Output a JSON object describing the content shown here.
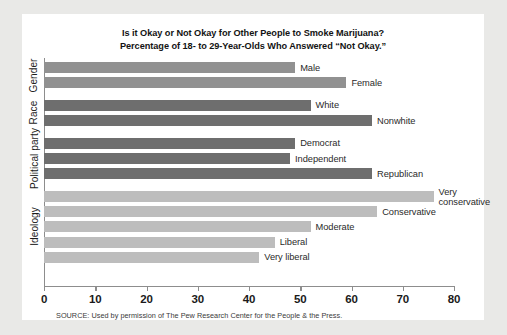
{
  "card": {
    "background": "#ffffff",
    "page_background": "#e9e9e7"
  },
  "title": {
    "line1": "Is it Okay or Not Okay for Other People to Smoke Marijuana?",
    "line2": "Percentage of 18- to 29-Year-Olds Who Answered “Not Okay.”"
  },
  "source": "SOURCE: Used by permission of The Pew Research Center for the People & the Press.",
  "groups": [
    {
      "label": "Gender",
      "color": "#919191"
    },
    {
      "label": "Race",
      "color": "#6e6e6e"
    },
    {
      "label": "Political party",
      "color": "#6e6e6e"
    },
    {
      "label": "Ideology",
      "color": "#bdbdbd"
    }
  ],
  "axis": {
    "ticks": [
      "0",
      "10",
      "20",
      "30",
      "40",
      "50",
      "60",
      "70",
      "80"
    ],
    "min": 0,
    "max": 80
  },
  "chart_data": {
    "type": "bar",
    "orientation": "horizontal",
    "title": "Is it Okay or Not Okay for Other People to Smoke Marijuana? Percentage of 18- to 29-Year-Olds Who Answered “Not Okay.”",
    "xlabel": "",
    "ylabel": "",
    "xlim": [
      0,
      80
    ],
    "xticks": [
      0,
      10,
      20,
      30,
      40,
      50,
      60,
      70,
      80
    ],
    "grid": false,
    "legend": "none",
    "source": "Used by permission of The Pew Research Center for the People & the Press.",
    "group_labels": [
      "Gender",
      "Race",
      "Political party",
      "Ideology"
    ],
    "categories": [
      "Male",
      "Female",
      "White",
      "Nonwhite",
      "Democrat",
      "Independent",
      "Republican",
      "Very conservative",
      "Conservative",
      "Moderate",
      "Liberal",
      "Very liberal"
    ],
    "values": [
      49,
      59,
      52,
      64,
      49,
      48,
      64,
      76,
      65,
      52,
      45,
      42
    ],
    "bars": [
      {
        "label": "Male",
        "value": 49,
        "group": "Gender",
        "color": "#919191"
      },
      {
        "label": "Female",
        "value": 59,
        "group": "Gender",
        "color": "#919191"
      },
      {
        "label": "White",
        "value": 52,
        "group": "Race",
        "color": "#6e6e6e"
      },
      {
        "label": "Nonwhite",
        "value": 64,
        "group": "Race",
        "color": "#6e6e6e"
      },
      {
        "label": "Democrat",
        "value": 49,
        "group": "Political party",
        "color": "#6e6e6e"
      },
      {
        "label": "Independent",
        "value": 48,
        "group": "Political party",
        "color": "#6e6e6e"
      },
      {
        "label": "Republican",
        "value": 64,
        "group": "Political party",
        "color": "#6e6e6e"
      },
      {
        "label": "Very conservative",
        "value": 76,
        "group": "Ideology",
        "color": "#bdbdbd"
      },
      {
        "label": "Conservative",
        "value": 65,
        "group": "Ideology",
        "color": "#bdbdbd"
      },
      {
        "label": "Moderate",
        "value": 52,
        "group": "Ideology",
        "color": "#bdbdbd"
      },
      {
        "label": "Liberal",
        "value": 45,
        "group": "Ideology",
        "color": "#bdbdbd"
      },
      {
        "label": "Very liberal",
        "value": 42,
        "group": "Ideology",
        "color": "#bdbdbd"
      }
    ]
  }
}
